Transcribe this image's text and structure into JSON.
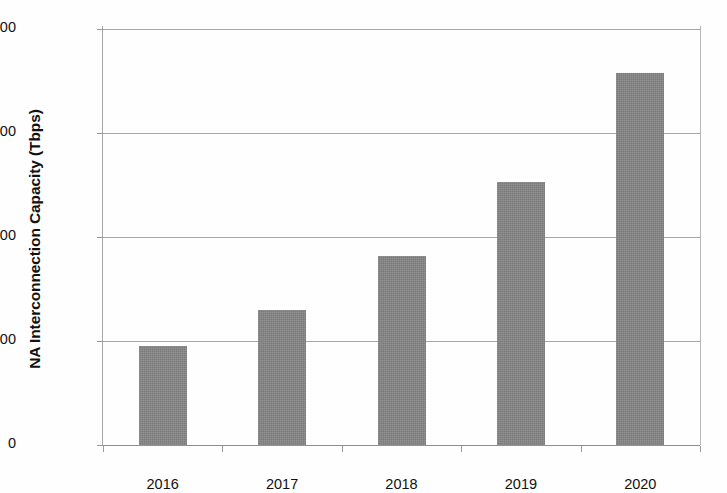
{
  "chart_data": {
    "type": "bar",
    "title": "",
    "xlabel": "",
    "ylabel": "NA Interconnection Capacity (Tbps)",
    "categories": [
      "2016",
      "2017",
      "2018",
      "2019",
      "2020"
    ],
    "values": [
      475,
      650,
      910,
      1265,
      1790
    ],
    "series": [
      {
        "name": "NA Interconnection Capacity",
        "values": [
          475,
          650,
          910,
          1265,
          1790
        ]
      }
    ],
    "ylim": [
      0,
      2000
    ],
    "yticks": [
      0,
      500,
      1000,
      1500,
      2000
    ],
    "ytick_labels": [
      "0",
      "500",
      "1000",
      "1500",
      "2000"
    ],
    "grid": true,
    "grid_axis": "y",
    "legend": false,
    "legend_position": "none",
    "bar_color": "#858585",
    "gridline_color": "#a6a6a6",
    "axis_color": "#8f8f8f",
    "text_color": "#111111",
    "background_color": "#ffffff"
  },
  "axes": {
    "y_title": "NA Interconnection Capacity (Tbps)"
  }
}
